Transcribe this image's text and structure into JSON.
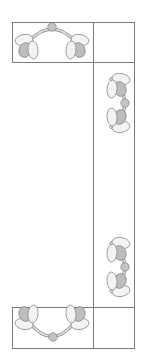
{
  "diagram": {
    "type": "quilt-border-layout",
    "colors": {
      "background": "#ffffff",
      "outline": "#8c8c8c",
      "frame": "#7a7a7a",
      "dark_petal": "#bdbdbd",
      "light_petal": "#f3f3f3",
      "stem": "#d9d9d9",
      "center_dot": "#c4c4c4"
    },
    "blocks": [
      {
        "name": "top-horizontal-block",
        "motif": "arch-up"
      },
      {
        "name": "top-right-corner-square",
        "motif": "empty"
      },
      {
        "name": "right-side-strip",
        "motif": "two-vertical-arches"
      },
      {
        "name": "bottom-horizontal-block",
        "motif": "arch-down"
      },
      {
        "name": "bottom-right-corner-square",
        "motif": "empty"
      }
    ]
  }
}
